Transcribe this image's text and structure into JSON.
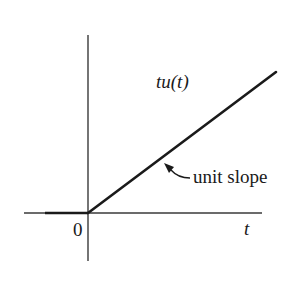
{
  "figure": {
    "type": "ramp-function-plot",
    "colors": {
      "background": "#ffffff",
      "ink": "#1a1a1a"
    },
    "axes": {
      "x_label": "t",
      "origin_label": "0"
    },
    "curve": {
      "label": "tu(t)",
      "label_parts": [
        "tu(",
        "t",
        ")"
      ],
      "description": "zero for t < 0, then rises linearly from origin"
    },
    "annotation": {
      "text": "unit slope"
    }
  }
}
